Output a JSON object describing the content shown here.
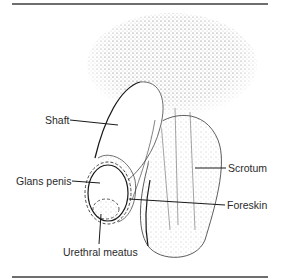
{
  "figure": {
    "labels": {
      "shaft": "Shaft",
      "glans": "Glans penis",
      "meatus": "Urethral meatus",
      "scrotum": "Scrotum",
      "foreskin": "Foreskin"
    },
    "colors": {
      "line": "#1a1a1a",
      "rule": "#6e6e6e",
      "stipple": "#555555",
      "text": "#2a2a2a"
    }
  }
}
